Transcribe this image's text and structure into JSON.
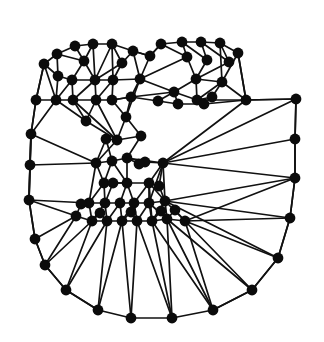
{
  "figure": {
    "kind": "graph-mesh-diagram",
    "title": "",
    "caption": "",
    "background_color": "#ffffff",
    "node_color": "#0b0b0b",
    "edge_color": "#111111",
    "node_radius": 5.4,
    "edge_width": 1.7,
    "width": 324,
    "height": 342
  },
  "chart_data": {
    "type": "scatter",
    "title": "",
    "xlabel": "",
    "ylabel": "",
    "xlim": [
      0,
      324
    ],
    "ylim": [
      0,
      342
    ],
    "grid": false,
    "legend": "none",
    "node_count": 88,
    "edge_count": 206,
    "nodes": [
      {
        "id": 0,
        "x": 75,
        "y": 46
      },
      {
        "id": 1,
        "x": 93,
        "y": 44
      },
      {
        "id": 2,
        "x": 112,
        "y": 44
      },
      {
        "id": 3,
        "x": 57,
        "y": 54
      },
      {
        "id": 4,
        "x": 133,
        "y": 51
      },
      {
        "id": 5,
        "x": 161,
        "y": 44
      },
      {
        "id": 6,
        "x": 182,
        "y": 42
      },
      {
        "id": 7,
        "x": 201,
        "y": 42
      },
      {
        "id": 8,
        "x": 220,
        "y": 43
      },
      {
        "id": 9,
        "x": 44,
        "y": 64
      },
      {
        "id": 10,
        "x": 238,
        "y": 53
      },
      {
        "id": 11,
        "x": 72,
        "y": 80
      },
      {
        "id": 12,
        "x": 95,
        "y": 80
      },
      {
        "id": 13,
        "x": 140,
        "y": 79
      },
      {
        "id": 14,
        "x": 196,
        "y": 79
      },
      {
        "id": 15,
        "x": 222,
        "y": 82
      },
      {
        "id": 16,
        "x": 36,
        "y": 100
      },
      {
        "id": 17,
        "x": 56,
        "y": 100
      },
      {
        "id": 18,
        "x": 73,
        "y": 100
      },
      {
        "id": 19,
        "x": 96,
        "y": 100
      },
      {
        "id": 20,
        "x": 112,
        "y": 100
      },
      {
        "id": 21,
        "x": 131,
        "y": 97
      },
      {
        "id": 22,
        "x": 174,
        "y": 92
      },
      {
        "id": 23,
        "x": 197,
        "y": 100
      },
      {
        "id": 24,
        "x": 246,
        "y": 100
      },
      {
        "id": 25,
        "x": 296,
        "y": 99
      },
      {
        "id": 26,
        "x": 126,
        "y": 117
      },
      {
        "id": 27,
        "x": 31,
        "y": 134
      },
      {
        "id": 28,
        "x": 295,
        "y": 139
      },
      {
        "id": 29,
        "x": 117,
        "y": 140
      },
      {
        "id": 30,
        "x": 30,
        "y": 165
      },
      {
        "id": 31,
        "x": 96,
        "y": 163
      },
      {
        "id": 32,
        "x": 112,
        "y": 161
      },
      {
        "id": 33,
        "x": 127,
        "y": 158
      },
      {
        "id": 34,
        "x": 163,
        "y": 163
      },
      {
        "id": 35,
        "x": 295,
        "y": 178
      },
      {
        "id": 36,
        "x": 104,
        "y": 183
      },
      {
        "id": 37,
        "x": 127,
        "y": 183
      },
      {
        "id": 38,
        "x": 149,
        "y": 183
      },
      {
        "id": 39,
        "x": 29,
        "y": 200
      },
      {
        "id": 40,
        "x": 89,
        "y": 203
      },
      {
        "id": 41,
        "x": 105,
        "y": 203
      },
      {
        "id": 42,
        "x": 120,
        "y": 203
      },
      {
        "id": 43,
        "x": 134,
        "y": 203
      },
      {
        "id": 44,
        "x": 149,
        "y": 203
      },
      {
        "id": 45,
        "x": 165,
        "y": 201
      },
      {
        "id": 46,
        "x": 290,
        "y": 218
      },
      {
        "id": 47,
        "x": 76,
        "y": 216
      },
      {
        "id": 48,
        "x": 92,
        "y": 221
      },
      {
        "id": 49,
        "x": 107,
        "y": 221
      },
      {
        "id": 50,
        "x": 122,
        "y": 221
      },
      {
        "id": 51,
        "x": 137,
        "y": 221
      },
      {
        "id": 52,
        "x": 152,
        "y": 221
      },
      {
        "id": 53,
        "x": 167,
        "y": 219
      },
      {
        "id": 54,
        "x": 185,
        "y": 221
      },
      {
        "id": 55,
        "x": 35,
        "y": 239
      },
      {
        "id": 56,
        "x": 278,
        "y": 258
      },
      {
        "id": 57,
        "x": 45,
        "y": 265
      },
      {
        "id": 58,
        "x": 66,
        "y": 290
      },
      {
        "id": 59,
        "x": 252,
        "y": 290
      },
      {
        "id": 60,
        "x": 98,
        "y": 310
      },
      {
        "id": 61,
        "x": 131,
        "y": 318
      },
      {
        "id": 62,
        "x": 172,
        "y": 318
      },
      {
        "id": 63,
        "x": 213,
        "y": 310
      },
      {
        "id": 64,
        "x": 150,
        "y": 56
      },
      {
        "id": 65,
        "x": 187,
        "y": 57
      },
      {
        "id": 66,
        "x": 207,
        "y": 60
      },
      {
        "id": 67,
        "x": 229,
        "y": 62
      },
      {
        "id": 68,
        "x": 84,
        "y": 61
      },
      {
        "id": 69,
        "x": 122,
        "y": 63
      },
      {
        "id": 70,
        "x": 58,
        "y": 76
      },
      {
        "id": 71,
        "x": 113,
        "y": 80
      },
      {
        "id": 72,
        "x": 158,
        "y": 101
      },
      {
        "id": 73,
        "x": 178,
        "y": 104
      },
      {
        "id": 74,
        "x": 212,
        "y": 97
      },
      {
        "id": 75,
        "x": 86,
        "y": 121
      },
      {
        "id": 76,
        "x": 145,
        "y": 162
      },
      {
        "id": 77,
        "x": 113,
        "y": 183
      },
      {
        "id": 78,
        "x": 139,
        "y": 164
      },
      {
        "id": 79,
        "x": 81,
        "y": 204
      },
      {
        "id": 80,
        "x": 159,
        "y": 186
      },
      {
        "id": 81,
        "x": 100,
        "y": 213
      },
      {
        "id": 82,
        "x": 131,
        "y": 212
      },
      {
        "id": 83,
        "x": 161,
        "y": 211
      },
      {
        "id": 84,
        "x": 175,
        "y": 210
      },
      {
        "id": 85,
        "x": 204,
        "y": 104
      },
      {
        "id": 86,
        "x": 141,
        "y": 136
      },
      {
        "id": 87,
        "x": 106,
        "y": 139
      }
    ],
    "edges": [
      [
        0,
        1
      ],
      [
        1,
        2
      ],
      [
        2,
        4
      ],
      [
        4,
        64
      ],
      [
        64,
        5
      ],
      [
        5,
        6
      ],
      [
        6,
        7
      ],
      [
        7,
        8
      ],
      [
        8,
        10
      ],
      [
        0,
        3
      ],
      [
        3,
        9
      ],
      [
        9,
        16
      ],
      [
        16,
        27
      ],
      [
        27,
        30
      ],
      [
        30,
        39
      ],
      [
        39,
        55
      ],
      [
        55,
        57
      ],
      [
        57,
        58
      ],
      [
        58,
        60
      ],
      [
        60,
        61
      ],
      [
        61,
        62
      ],
      [
        62,
        63
      ],
      [
        63,
        59
      ],
      [
        59,
        56
      ],
      [
        56,
        46
      ],
      [
        46,
        35
      ],
      [
        35,
        28
      ],
      [
        28,
        25
      ],
      [
        25,
        24
      ],
      [
        24,
        10
      ],
      [
        0,
        68
      ],
      [
        68,
        3
      ],
      [
        68,
        11
      ],
      [
        68,
        12
      ],
      [
        1,
        68
      ],
      [
        1,
        12
      ],
      [
        2,
        12
      ],
      [
        2,
        71
      ],
      [
        2,
        69
      ],
      [
        69,
        4
      ],
      [
        69,
        71
      ],
      [
        69,
        12
      ],
      [
        4,
        13
      ],
      [
        4,
        64
      ],
      [
        64,
        13
      ],
      [
        5,
        64
      ],
      [
        5,
        65
      ],
      [
        65,
        6
      ],
      [
        65,
        13
      ],
      [
        65,
        14
      ],
      [
        6,
        66
      ],
      [
        66,
        7
      ],
      [
        66,
        14
      ],
      [
        7,
        67
      ],
      [
        67,
        8
      ],
      [
        67,
        14
      ],
      [
        8,
        15
      ],
      [
        10,
        15
      ],
      [
        10,
        24
      ],
      [
        3,
        70
      ],
      [
        70,
        9
      ],
      [
        70,
        11
      ],
      [
        70,
        17
      ],
      [
        9,
        17
      ],
      [
        9,
        16
      ],
      [
        11,
        12
      ],
      [
        11,
        17
      ],
      [
        11,
        18
      ],
      [
        12,
        18
      ],
      [
        12,
        19
      ],
      [
        12,
        71
      ],
      [
        71,
        19
      ],
      [
        71,
        20
      ],
      [
        71,
        13
      ],
      [
        13,
        21
      ],
      [
        13,
        22
      ],
      [
        13,
        26
      ],
      [
        21,
        20
      ],
      [
        21,
        26
      ],
      [
        21,
        22
      ],
      [
        22,
        14
      ],
      [
        22,
        23
      ],
      [
        22,
        72
      ],
      [
        22,
        73
      ],
      [
        14,
        23
      ],
      [
        14,
        15
      ],
      [
        15,
        23
      ],
      [
        15,
        24
      ],
      [
        23,
        24
      ],
      [
        23,
        74
      ],
      [
        74,
        15
      ],
      [
        85,
        23
      ],
      [
        85,
        24
      ],
      [
        16,
        17
      ],
      [
        17,
        18
      ],
      [
        18,
        19
      ],
      [
        19,
        20
      ],
      [
        20,
        21
      ],
      [
        21,
        72
      ],
      [
        72,
        73
      ],
      [
        73,
        85
      ],
      [
        16,
        27
      ],
      [
        17,
        27
      ],
      [
        17,
        75
      ],
      [
        75,
        18
      ],
      [
        75,
        19
      ],
      [
        75,
        29
      ],
      [
        18,
        29
      ],
      [
        19,
        29
      ],
      [
        20,
        26
      ],
      [
        26,
        29
      ],
      [
        26,
        86
      ],
      [
        86,
        29
      ],
      [
        86,
        33
      ],
      [
        27,
        30
      ],
      [
        27,
        31
      ],
      [
        27,
        39
      ],
      [
        29,
        31
      ],
      [
        29,
        87
      ],
      [
        87,
        31
      ],
      [
        87,
        32
      ],
      [
        30,
        31
      ],
      [
        30,
        39
      ],
      [
        31,
        32
      ],
      [
        32,
        33
      ],
      [
        33,
        76
      ],
      [
        76,
        34
      ],
      [
        76,
        78
      ],
      [
        78,
        33
      ],
      [
        33,
        34
      ],
      [
        34,
        24
      ],
      [
        34,
        25
      ],
      [
        34,
        28
      ],
      [
        34,
        35
      ],
      [
        34,
        38
      ],
      [
        34,
        80
      ],
      [
        31,
        36
      ],
      [
        31,
        40
      ],
      [
        32,
        36
      ],
      [
        32,
        37
      ],
      [
        33,
        37
      ],
      [
        36,
        37
      ],
      [
        37,
        38
      ],
      [
        38,
        80
      ],
      [
        80,
        45
      ],
      [
        38,
        44
      ],
      [
        38,
        45
      ],
      [
        36,
        77
      ],
      [
        77,
        37
      ],
      [
        77,
        41
      ],
      [
        39,
        40
      ],
      [
        39,
        47
      ],
      [
        39,
        55
      ],
      [
        40,
        41
      ],
      [
        41,
        42
      ],
      [
        42,
        43
      ],
      [
        43,
        44
      ],
      [
        44,
        45
      ],
      [
        36,
        41
      ],
      [
        36,
        40
      ],
      [
        37,
        42
      ],
      [
        37,
        43
      ],
      [
        38,
        43
      ],
      [
        79,
        40
      ],
      [
        79,
        47
      ],
      [
        40,
        48
      ],
      [
        41,
        48
      ],
      [
        41,
        49
      ],
      [
        42,
        49
      ],
      [
        42,
        50
      ],
      [
        43,
        50
      ],
      [
        43,
        51
      ],
      [
        44,
        51
      ],
      [
        44,
        52
      ],
      [
        45,
        52
      ],
      [
        45,
        53
      ],
      [
        45,
        54
      ],
      [
        47,
        48
      ],
      [
        48,
        49
      ],
      [
        49,
        50
      ],
      [
        50,
        51
      ],
      [
        51,
        52
      ],
      [
        52,
        53
      ],
      [
        53,
        54
      ],
      [
        81,
        48
      ],
      [
        81,
        49
      ],
      [
        82,
        50
      ],
      [
        82,
        51
      ],
      [
        83,
        52
      ],
      [
        83,
        53
      ],
      [
        84,
        53
      ],
      [
        84,
        54
      ],
      [
        47,
        55
      ],
      [
        47,
        57
      ],
      [
        48,
        58
      ],
      [
        48,
        57
      ],
      [
        49,
        60
      ],
      [
        50,
        61
      ],
      [
        51,
        61
      ],
      [
        52,
        62
      ],
      [
        53,
        62
      ],
      [
        54,
        63
      ],
      [
        54,
        59
      ],
      [
        54,
        56
      ],
      [
        54,
        46
      ],
      [
        54,
        35
      ],
      [
        45,
        35
      ],
      [
        45,
        46
      ],
      [
        45,
        56
      ],
      [
        53,
        59
      ],
      [
        53,
        63
      ],
      [
        55,
        57
      ],
      [
        57,
        58
      ],
      [
        58,
        60
      ],
      [
        59,
        63
      ],
      [
        56,
        59
      ],
      [
        46,
        56
      ],
      [
        49,
        58
      ],
      [
        50,
        60
      ],
      [
        51,
        62
      ],
      [
        52,
        63
      ],
      [
        25,
        28
      ],
      [
        28,
        35
      ],
      [
        35,
        46
      ],
      [
        24,
        25
      ],
      [
        34,
        45
      ],
      [
        34,
        44
      ],
      [
        38,
        52
      ],
      [
        44,
        53
      ]
    ]
  }
}
